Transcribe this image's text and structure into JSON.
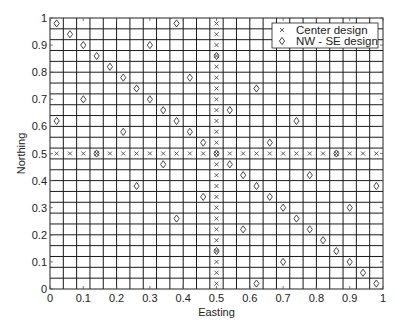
{
  "chart_data": {
    "type": "scatter",
    "title": "",
    "xlabel": "Easting",
    "ylabel": "Northing",
    "xlim": [
      0,
      1
    ],
    "ylim": [
      0,
      1
    ],
    "grid": true,
    "grid_step": 0.04,
    "xticks": [
      0,
      0.1,
      0.2,
      0.3,
      0.4,
      0.5,
      0.6,
      0.7,
      0.8,
      0.9,
      1
    ],
    "xtick_labels": [
      "0",
      "0.1",
      "0.2",
      "0.3",
      "0.4",
      "0.5",
      "0.6",
      "0.7",
      "0.8",
      "0.9",
      "1"
    ],
    "yticks": [
      0,
      0.1,
      0.2,
      0.3,
      0.4,
      0.5,
      0.6,
      0.7,
      0.8,
      0.9,
      1
    ],
    "ytick_labels": [
      "0",
      "0.1",
      "0.2",
      "0.3",
      "0.4",
      "0.5",
      "0.6",
      "0.7",
      "0.8",
      "0.9",
      "1"
    ],
    "legend_position": "upper right",
    "series": [
      {
        "name": "Center design",
        "marker": "x",
        "points": [
          [
            0.02,
            0.5
          ],
          [
            0.06,
            0.5
          ],
          [
            0.1,
            0.5
          ],
          [
            0.14,
            0.5
          ],
          [
            0.18,
            0.5
          ],
          [
            0.22,
            0.5
          ],
          [
            0.26,
            0.5
          ],
          [
            0.3,
            0.5
          ],
          [
            0.34,
            0.5
          ],
          [
            0.38,
            0.5
          ],
          [
            0.42,
            0.5
          ],
          [
            0.46,
            0.5
          ],
          [
            0.5,
            0.5
          ],
          [
            0.54,
            0.5
          ],
          [
            0.58,
            0.5
          ],
          [
            0.62,
            0.5
          ],
          [
            0.66,
            0.5
          ],
          [
            0.7,
            0.5
          ],
          [
            0.74,
            0.5
          ],
          [
            0.78,
            0.5
          ],
          [
            0.82,
            0.5
          ],
          [
            0.86,
            0.5
          ],
          [
            0.9,
            0.5
          ],
          [
            0.94,
            0.5
          ],
          [
            0.98,
            0.5
          ],
          [
            0.5,
            0.02
          ],
          [
            0.5,
            0.06
          ],
          [
            0.5,
            0.1
          ],
          [
            0.5,
            0.14
          ],
          [
            0.5,
            0.18
          ],
          [
            0.5,
            0.22
          ],
          [
            0.5,
            0.26
          ],
          [
            0.5,
            0.3
          ],
          [
            0.5,
            0.34
          ],
          [
            0.5,
            0.38
          ],
          [
            0.5,
            0.42
          ],
          [
            0.5,
            0.46
          ],
          [
            0.5,
            0.54
          ],
          [
            0.5,
            0.58
          ],
          [
            0.5,
            0.62
          ],
          [
            0.5,
            0.66
          ],
          [
            0.5,
            0.7
          ],
          [
            0.5,
            0.74
          ],
          [
            0.5,
            0.78
          ],
          [
            0.5,
            0.82
          ],
          [
            0.5,
            0.86
          ],
          [
            0.5,
            0.9
          ],
          [
            0.5,
            0.94
          ],
          [
            0.5,
            0.98
          ]
        ]
      },
      {
        "name": "NW - SE design",
        "marker": "diamond",
        "points": [
          [
            0.02,
            0.98
          ],
          [
            0.06,
            0.94
          ],
          [
            0.1,
            0.9
          ],
          [
            0.14,
            0.86
          ],
          [
            0.18,
            0.82
          ],
          [
            0.22,
            0.78
          ],
          [
            0.26,
            0.74
          ],
          [
            0.3,
            0.7
          ],
          [
            0.34,
            0.66
          ],
          [
            0.38,
            0.62
          ],
          [
            0.42,
            0.58
          ],
          [
            0.46,
            0.54
          ],
          [
            0.5,
            0.5
          ],
          [
            0.54,
            0.46
          ],
          [
            0.58,
            0.42
          ],
          [
            0.62,
            0.38
          ],
          [
            0.66,
            0.34
          ],
          [
            0.7,
            0.3
          ],
          [
            0.74,
            0.26
          ],
          [
            0.78,
            0.22
          ],
          [
            0.82,
            0.18
          ],
          [
            0.86,
            0.14
          ],
          [
            0.9,
            0.1
          ],
          [
            0.94,
            0.06
          ],
          [
            0.98,
            0.02
          ],
          [
            0.02,
            0.62
          ],
          [
            0.14,
            0.5
          ],
          [
            0.26,
            0.38
          ],
          [
            0.38,
            0.26
          ],
          [
            0.5,
            0.14
          ],
          [
            0.62,
            0.02
          ],
          [
            0.1,
            0.7
          ],
          [
            0.22,
            0.58
          ],
          [
            0.34,
            0.46
          ],
          [
            0.46,
            0.34
          ],
          [
            0.58,
            0.22
          ],
          [
            0.7,
            0.1
          ],
          [
            0.3,
            0.9
          ],
          [
            0.42,
            0.78
          ],
          [
            0.54,
            0.66
          ],
          [
            0.66,
            0.54
          ],
          [
            0.78,
            0.42
          ],
          [
            0.9,
            0.3
          ],
          [
            0.38,
            0.98
          ],
          [
            0.5,
            0.86
          ],
          [
            0.62,
            0.74
          ],
          [
            0.74,
            0.62
          ],
          [
            0.86,
            0.5
          ],
          [
            0.98,
            0.38
          ]
        ]
      }
    ]
  },
  "legend": {
    "items": [
      {
        "label": "Center design",
        "symbol": "×"
      },
      {
        "label": "NW - SE design",
        "symbol": "◇"
      }
    ]
  },
  "colors": {
    "grid": "#1a1a1a",
    "axis": "#222222",
    "marker": "#333333",
    "background": "#ffffff"
  }
}
